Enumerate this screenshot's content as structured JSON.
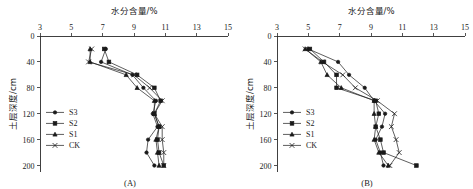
{
  "figure": {
    "width": 473,
    "height": 189,
    "background": "#ffffff",
    "ink_color": "#1a1a1a"
  },
  "chart_data": [
    {
      "type": "line",
      "panel_label": "(A)",
      "title": "",
      "xlabel": "水分含量/%",
      "ylabel": "土层深度/cm",
      "xlim": [
        3,
        15
      ],
      "ylim": [
        0,
        210
      ],
      "y_inverted": true,
      "xticks": [
        3,
        5,
        7,
        9,
        11,
        13,
        15
      ],
      "yticks": [
        0,
        40,
        80,
        120,
        160,
        200
      ],
      "grid": false,
      "legend_position": "left-middle",
      "x_axis_position": "top",
      "series": [
        {
          "name": "S3",
          "marker": "circle",
          "depths": [
            20,
            40,
            60,
            80,
            100,
            120,
            140,
            160,
            180,
            200
          ],
          "values": [
            7.2,
            6.9,
            8.9,
            9.6,
            10.4,
            10.2,
            10.5,
            9.9,
            9.8,
            10.3
          ]
        },
        {
          "name": "S2",
          "marker": "square",
          "depths": [
            20,
            40,
            60,
            80,
            100,
            120,
            140,
            160,
            180,
            200
          ],
          "values": [
            7.1,
            7.4,
            9.2,
            10.3,
            10.7,
            10.3,
            10.6,
            10.5,
            10.6,
            10.9
          ]
        },
        {
          "name": "S1",
          "marker": "triangle",
          "depths": [
            20,
            40,
            60,
            80,
            100,
            120,
            140,
            160,
            180,
            200
          ],
          "values": [
            6.2,
            6.2,
            8.5,
            9.2,
            10.3,
            10.3,
            10.6,
            10.4,
            10.5,
            10.6
          ]
        },
        {
          "name": "CK",
          "marker": "cross",
          "depths": [
            20,
            40,
            60,
            80,
            100,
            120,
            140,
            160,
            180,
            200
          ],
          "values": [
            6.3,
            6.1,
            9.0,
            10.0,
            10.8,
            10.3,
            10.8,
            10.8,
            10.9,
            10.9
          ]
        }
      ]
    },
    {
      "type": "line",
      "panel_label": "(B)",
      "title": "",
      "xlabel": "水分含量/%",
      "ylabel": "土层深度/cm",
      "xlim": [
        3,
        15
      ],
      "ylim": [
        0,
        210
      ],
      "y_inverted": true,
      "xticks": [
        3,
        5,
        7,
        9,
        11,
        13,
        15
      ],
      "yticks": [
        0,
        40,
        80,
        120,
        160,
        200
      ],
      "grid": false,
      "legend_position": "left-middle",
      "x_axis_position": "top",
      "series": [
        {
          "name": "S3",
          "marker": "circle",
          "depths": [
            20,
            40,
            60,
            80,
            100,
            120,
            140,
            160,
            180,
            200
          ],
          "values": [
            5.0,
            6.9,
            7.6,
            8.6,
            9.2,
            9.9,
            9.7,
            9.3,
            9.6,
            9.8
          ]
        },
        {
          "name": "S2",
          "marker": "square",
          "depths": [
            20,
            40,
            60,
            80,
            100,
            120,
            140,
            160,
            180,
            200
          ],
          "values": [
            5.1,
            6.0,
            6.8,
            6.8,
            9.3,
            9.5,
            9.3,
            9.6,
            9.8,
            11.9
          ]
        },
        {
          "name": "S1",
          "marker": "triangle",
          "depths": [
            20,
            40,
            60,
            80,
            100,
            120,
            140,
            160,
            180,
            200
          ],
          "values": [
            4.8,
            5.8,
            6.2,
            7.1,
            9.2,
            9.2,
            9.3,
            9.2,
            9.5,
            10.1
          ]
        },
        {
          "name": "CK",
          "marker": "cross",
          "depths": [
            20,
            40,
            60,
            80,
            100,
            120,
            140,
            160,
            180,
            200
          ],
          "values": [
            4.8,
            5.9,
            7.2,
            8.0,
            9.4,
            10.5,
            10.3,
            10.6,
            10.8,
            10.2
          ]
        }
      ]
    }
  ],
  "legend": {
    "entries": [
      {
        "label": "S3",
        "marker": "circle"
      },
      {
        "label": "S2",
        "marker": "square"
      },
      {
        "label": "S1",
        "marker": "triangle"
      },
      {
        "label": "CK",
        "marker": "cross"
      }
    ]
  }
}
